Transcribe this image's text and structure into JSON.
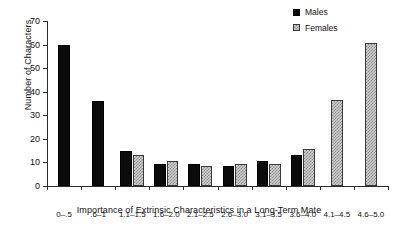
{
  "chart_data": {
    "type": "bar",
    "title": "",
    "xlabel": "Importance of Extrinsic Characteristics in a Long-Term Mate",
    "ylabel": "Number of Characters",
    "categories": [
      "0–.5",
      ".6–1",
      "1.1–1.5",
      "1.6–2.0",
      "2.1–2.5",
      "2.6–3.0",
      "3.1–3.5",
      "3.6–4.0",
      "4.1–4.5",
      "4.6–5.0"
    ],
    "series": [
      {
        "name": "Males",
        "color": "#0b0b0b",
        "pattern": "solid",
        "values": [
          60,
          36,
          15,
          9.5,
          9.5,
          8.5,
          10.5,
          13,
          0,
          0
        ]
      },
      {
        "name": "Females",
        "color": "#d2d2d2",
        "pattern": "checker",
        "values": [
          0,
          0,
          13,
          10.5,
          8.5,
          9.5,
          9.5,
          15.5,
          36.5,
          60.5
        ]
      }
    ],
    "ylim": [
      0,
      70
    ],
    "yticks": [
      0,
      10,
      20,
      30,
      40,
      50,
      60,
      70
    ],
    "ytick_labels": [
      "0",
      "10",
      "20",
      "30",
      "40",
      "50",
      "60",
      "70"
    ],
    "grid": false,
    "legend_position": "top-right",
    "legend_entries": [
      "Males",
      "Females"
    ]
  }
}
